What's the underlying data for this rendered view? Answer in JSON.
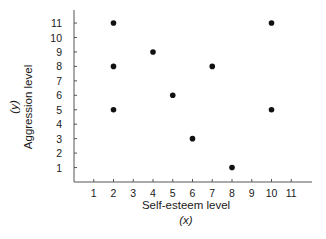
{
  "chart_data": {
    "type": "scatter",
    "title": "",
    "xlabel": "Self-esteem level",
    "xlabel_var": "(x)",
    "ylabel": "Aggression level",
    "ylabel_var": "(y)",
    "xlim": [
      0,
      12
    ],
    "ylim": [
      0,
      11.8
    ],
    "xticks": [
      1,
      2,
      3,
      4,
      5,
      6,
      7,
      8,
      9,
      10,
      11
    ],
    "yticks": [
      1,
      2,
      3,
      4,
      5,
      6,
      7,
      8,
      9,
      10,
      11
    ],
    "grid": false,
    "legend": null,
    "series": [
      {
        "name": "observations",
        "color": "#111111",
        "points": [
          {
            "x": 2,
            "y": 11
          },
          {
            "x": 2,
            "y": 8
          },
          {
            "x": 2,
            "y": 5
          },
          {
            "x": 4,
            "y": 9
          },
          {
            "x": 5,
            "y": 6
          },
          {
            "x": 6,
            "y": 3
          },
          {
            "x": 7,
            "y": 8
          },
          {
            "x": 8,
            "y": 1
          },
          {
            "x": 10,
            "y": 11
          },
          {
            "x": 10,
            "y": 5
          }
        ]
      }
    ]
  },
  "colors": {
    "axis": "#555555",
    "text": "#1a1a1a",
    "point": "#111111",
    "background": "#ffffff"
  }
}
